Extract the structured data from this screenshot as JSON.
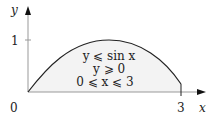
{
  "diagram": {
    "axes": {
      "x_label": "x",
      "y_label": "y",
      "origin_label": "0",
      "x_tick_label": "3",
      "y_tick_label": "1"
    },
    "region_conditions": [
      "y ⩽ sin x",
      "y ⩾ 0",
      "0 ⩽ x ⩽ 3"
    ],
    "curve": "y = sin x",
    "domain": [
      0,
      3
    ],
    "fill_color": "#f2f2f2",
    "line_color": "#222222"
  }
}
